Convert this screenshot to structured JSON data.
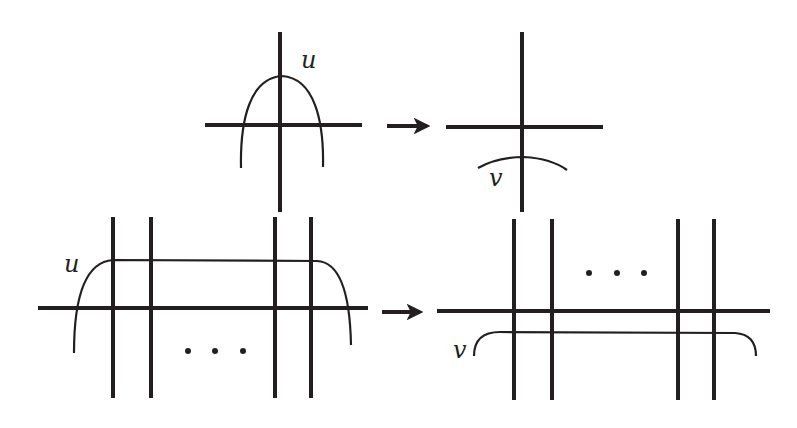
{
  "colors": {
    "ink": "#231f20",
    "background": "#ffffff"
  },
  "panels": {
    "top_left": {
      "curve_label": "u"
    },
    "top_right": {
      "curve_label": "v"
    },
    "bottom_left": {
      "curve_label": "u",
      "ellipsis": "· · ·"
    },
    "bottom_right": {
      "curve_label": "v",
      "ellipsis": "· · ·"
    }
  },
  "arrows": {
    "top": "right-arrow",
    "bottom": "right-arrow"
  }
}
